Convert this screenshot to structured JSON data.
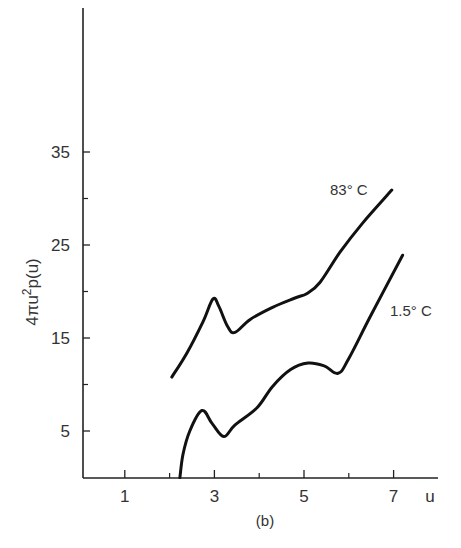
{
  "chart_data": {
    "type": "line",
    "title": "",
    "caption": "(b)",
    "xlabel": "u",
    "ylabel": "4πu²p(u)",
    "ylabel_parts": {
      "prefix": "4πu",
      "sup": "2",
      "suffix": "p(u)"
    },
    "xlim": [
      0,
      8
    ],
    "ylim": [
      0,
      45
    ],
    "grid": false,
    "x_major_ticks": [
      1,
      3,
      5,
      7
    ],
    "x_minor_ticks": [
      2,
      4,
      6
    ],
    "x_tick_labels": [
      "1",
      "3",
      "5",
      "7"
    ],
    "y_major_ticks": [
      5,
      15,
      25,
      35
    ],
    "y_minor_ticks": [
      10,
      20,
      30
    ],
    "y_tick_labels": [
      "5",
      "15",
      "25",
      "35"
    ],
    "series": [
      {
        "name": "83° C",
        "label": "83° C",
        "points": [
          [
            2.05,
            10.8
          ],
          [
            2.4,
            13.5
          ],
          [
            2.75,
            16.8
          ],
          [
            2.97,
            19.2
          ],
          [
            3.1,
            18.4
          ],
          [
            3.3,
            16.2
          ],
          [
            3.46,
            15.6
          ],
          [
            3.8,
            17.0
          ],
          [
            4.3,
            18.3
          ],
          [
            4.8,
            19.3
          ],
          [
            5.07,
            19.8
          ],
          [
            5.36,
            21.0
          ],
          [
            5.8,
            24.2
          ],
          [
            6.3,
            27.3
          ],
          [
            6.96,
            30.9
          ]
        ]
      },
      {
        "name": "1.5° C",
        "label": "1.5° C",
        "points": [
          [
            2.23,
            0.0
          ],
          [
            2.3,
            2.5
          ],
          [
            2.45,
            5.0
          ],
          [
            2.72,
            7.2
          ],
          [
            2.95,
            5.8
          ],
          [
            3.21,
            4.4
          ],
          [
            3.45,
            5.6
          ],
          [
            3.95,
            7.5
          ],
          [
            4.3,
            9.8
          ],
          [
            4.7,
            11.6
          ],
          [
            5.09,
            12.3
          ],
          [
            5.45,
            12.0
          ],
          [
            5.76,
            11.2
          ],
          [
            6.0,
            12.8
          ],
          [
            6.5,
            17.5
          ],
          [
            7.2,
            23.9
          ]
        ]
      }
    ]
  }
}
